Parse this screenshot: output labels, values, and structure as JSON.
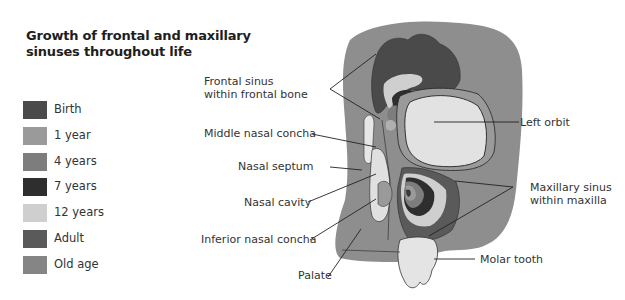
{
  "title": {
    "line1": "Growth of frontal and maxillary",
    "line2": "sinuses throughout life"
  },
  "legend": [
    {
      "label": "Birth",
      "color": "#4a4a4a"
    },
    {
      "label": "1 year",
      "color": "#9a9a9a"
    },
    {
      "label": "4 years",
      "color": "#7d7d7d"
    },
    {
      "label": "7 years",
      "color": "#2e2e2e"
    },
    {
      "label": "12 years",
      "color": "#cfcfcf"
    },
    {
      "label": "Adult",
      "color": "#5a5a5a"
    },
    {
      "label": "Old age",
      "color": "#858585"
    }
  ],
  "labels": {
    "frontal_sinus_1": "Frontal sinus",
    "frontal_sinus_2": "within frontal bone",
    "middle_nasal_concha": "Middle nasal concha",
    "nasal_septum": "Nasal septum",
    "nasal_cavity": "Nasal cavity",
    "inferior_nasal_concha": "Inferior nasal concha",
    "palate": "Palate",
    "left_orbit": "Left orbit",
    "maxillary_sinus_1": "Maxillary sinus",
    "maxillary_sinus_2": "within maxilla",
    "molar_tooth": "Molar tooth"
  },
  "colors": {
    "bone": "#8f8f8f",
    "bone_dark": "#7a7a7a",
    "orbit": "#e2e2e2",
    "outline": "#222222"
  }
}
